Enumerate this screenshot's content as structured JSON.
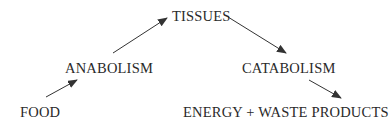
{
  "diagram": {
    "nodes": {
      "tissues": "TISSUES",
      "anabolism": "ANABOLISM",
      "catabolism": "CATABOLISM",
      "food": "FOOD",
      "energy": "ENERGY + WASTE PRODUCTS"
    },
    "edges": [
      {
        "from": "FOOD",
        "to": "ANABOLISM"
      },
      {
        "from": "ANABOLISM",
        "to": "TISSUES"
      },
      {
        "from": "TISSUES",
        "to": "CATABOLISM"
      },
      {
        "from": "CATABOLISM",
        "to": "ENERGY + WASTE PRODUCTS"
      }
    ],
    "colors": {
      "text": "#2a2a2a",
      "arrow": "#333333",
      "background": "#ffffff"
    }
  }
}
